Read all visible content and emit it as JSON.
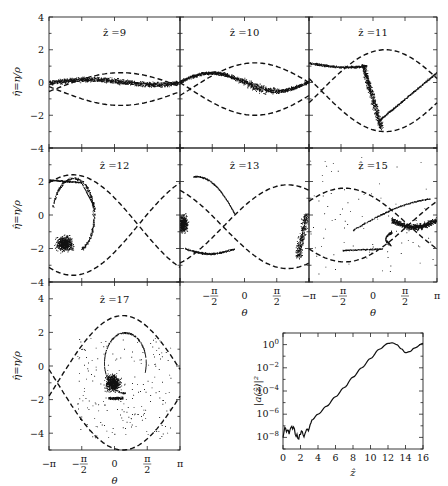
{
  "figure": {
    "ylabel": "η̂=η/ρ",
    "xlabel": "θ",
    "inset_ylabel": "|a(ẑ)|²",
    "inset_xlabel": "ẑ"
  },
  "chart_data": [
    {
      "type": "scatter",
      "title": "ẑ =9",
      "xlabel": "",
      "ylabel": "η̂=η/ρ",
      "xlim": [
        -3.1416,
        3.1416
      ],
      "ylim": [
        -4,
        4
      ],
      "yticks": [
        "4",
        "2",
        "0",
        "-2",
        "-4"
      ],
      "separatrix_center": -0.4,
      "separatrix_amp": 1.0,
      "separatrix_phase": 0.3,
      "particles": "thin band near η̂≈0, slight sinusoidal modulation"
    },
    {
      "type": "scatter",
      "title": "ẑ =10",
      "xlim": [
        -3.1416,
        3.1416
      ],
      "ylim": [
        -4,
        4
      ],
      "separatrix_center": -0.4,
      "separatrix_amp": 1.6,
      "separatrix_phase": 0.5,
      "particles": "S-shaped band beginning to roll up"
    },
    {
      "type": "scatter",
      "title": "ẑ =11",
      "xlim": [
        -3.1416,
        3.1416
      ],
      "ylim": [
        -4,
        4
      ],
      "separatrix_center": -0.5,
      "separatrix_amp": 2.5,
      "separatrix_phase": 0.6,
      "particles": "band over-turning into hook inside separatrix"
    },
    {
      "type": "scatter",
      "title": "ẑ =12",
      "xlabel": "",
      "ylabel": "η̂=η/ρ",
      "xlim": [
        -3.1416,
        3.1416
      ],
      "ylim": [
        -4,
        4
      ],
      "yticks": [
        "2",
        "0",
        "-2",
        "-4"
      ],
      "separatrix_center": -0.6,
      "separatrix_amp": 3.0,
      "separatrix_phase": -2.0,
      "particles": "spiral roll-up, dense core near θ≈-2.5, η̂≈-1.7"
    },
    {
      "type": "scatter",
      "title": "ẑ =13",
      "xlabel": "θ",
      "xlim": [
        -3.1416,
        3.1416
      ],
      "ylim": [
        -4,
        4
      ],
      "xticks": [
        "-π/2",
        "0",
        "π/2"
      ],
      "separatrix_center": -0.7,
      "separatrix_amp": 2.5,
      "separatrix_phase": 2.1,
      "particles": "bunch split across θ=±π, curved arcs"
    },
    {
      "type": "scatter",
      "title": "ẑ =15",
      "xlabel": "θ",
      "xlim": [
        -3.1416,
        3.1416
      ],
      "ylim": [
        -4,
        4
      ],
      "xticks": [
        "-π",
        "-π/2",
        "0",
        "π/2",
        "π"
      ],
      "separatrix_center": -0.6,
      "separatrix_amp": 2.2,
      "separatrix_phase": -1.4,
      "particles": "dense crescent near θ≈1.5–3, η̂≈-0.7"
    },
    {
      "type": "scatter",
      "title": "ẑ =17",
      "xlabel": "θ",
      "ylabel": "η̂=η/ρ",
      "xlim": [
        -3.1416,
        3.1416
      ],
      "ylim": [
        -5,
        5
      ],
      "xticks": [
        "-π",
        "-π/2",
        "0",
        "π/2",
        "π"
      ],
      "yticks": [
        "4",
        "2",
        "0",
        "-2",
        "-4"
      ],
      "separatrix_center": -1.0,
      "separatrix_amp": 4.0,
      "separatrix_phase": 0.4,
      "particles": "spiral core near θ≈0, η̂≈-1, scattered arcs"
    },
    {
      "type": "line",
      "title": "",
      "xlabel": "ẑ",
      "ylabel": "|a(ẑ)|²",
      "xlim": [
        0,
        16
      ],
      "ylim_log10": [
        -9,
        1
      ],
      "xticks": [
        "0",
        "2",
        "4",
        "6",
        "8",
        "10",
        "12",
        "14",
        "16"
      ],
      "yticks": [
        "10⁰",
        "10⁻²",
        "10⁻⁴",
        "10⁻⁶",
        "10⁻⁸"
      ],
      "x": [
        0,
        0.3,
        0.6,
        0.9,
        1.2,
        1.5,
        1.8,
        2.1,
        2.4,
        2.7,
        3.0,
        3.3,
        4.0,
        5.0,
        6.0,
        7.0,
        8.0,
        9.0,
        10.0,
        11.0,
        12.0,
        12.5,
        13.0,
        13.5,
        14.0,
        14.5,
        15.0,
        16.0
      ],
      "log10y": [
        -7.8,
        -7.2,
        -7.6,
        -7.3,
        -7.0,
        -7.9,
        -8.1,
        -7.6,
        -7.8,
        -7.2,
        -7.3,
        -6.5,
        -6.0,
        -5.3,
        -4.5,
        -3.7,
        -2.8,
        -2.0,
        -1.2,
        -0.4,
        0.1,
        0.15,
        0.0,
        -0.35,
        -0.7,
        -0.6,
        -0.3,
        0.1
      ]
    }
  ]
}
